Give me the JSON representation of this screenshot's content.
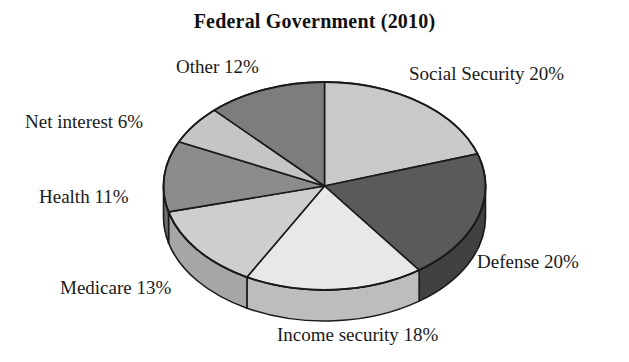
{
  "chart_data": {
    "type": "pie",
    "title": "Federal Government (2010)",
    "subtitle": "",
    "xlabel": "",
    "ylabel": "",
    "legend_position": "none",
    "grid": false,
    "labels_outside": true,
    "three_d": true,
    "start_angle_deg": 0,
    "direction": "clockwise",
    "categories": [
      "Social Security",
      "Defense",
      "Income security",
      "Medicare",
      "Health",
      "Net interest",
      "Other"
    ],
    "values": [
      20,
      20,
      18,
      13,
      11,
      6,
      12
    ],
    "units": "percent",
    "slices": [
      {
        "name": "Social Security",
        "value": 20,
        "label": "Social Security 20%",
        "color": "#c9c9c9",
        "side_color": "#a2a2a2"
      },
      {
        "name": "Defense",
        "value": 20,
        "label": "Defense 20%",
        "color": "#5a5a5a",
        "side_color": "#414141"
      },
      {
        "name": "Income security",
        "value": 18,
        "label": "Income security 18%",
        "color": "#e8e8e8",
        "side_color": "#bdbdbd"
      },
      {
        "name": "Medicare",
        "value": 13,
        "label": "Medicare 13%",
        "color": "#cecece",
        "side_color": "#a6a6a6"
      },
      {
        "name": "Health",
        "value": 11,
        "label": "Health 11%",
        "color": "#8c8c8c",
        "side_color": "#6e6e6e"
      },
      {
        "name": "Net interest",
        "value": 6,
        "label": "Net interest 6%",
        "color": "#c5c5c5",
        "side_color": "#9c9c9c"
      },
      {
        "name": "Other",
        "value": 12,
        "label": "Other 12%",
        "color": "#7d7d7d",
        "side_color": "#606060"
      }
    ],
    "outline_color": "#1a1a1a",
    "background": "#ffffff"
  }
}
